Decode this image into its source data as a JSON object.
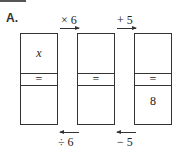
{
  "problem_label": "A.",
  "forward_ops": [
    "× 6",
    "+ 5"
  ],
  "inverse_ops": [
    "÷ 6",
    "− 5"
  ],
  "boxes": [
    {
      "top": "x",
      "equals": "=",
      "bottom": ""
    },
    {
      "top": "",
      "equals": "=",
      "bottom": ""
    },
    {
      "top": "",
      "equals": "=",
      "bottom": "8"
    }
  ]
}
